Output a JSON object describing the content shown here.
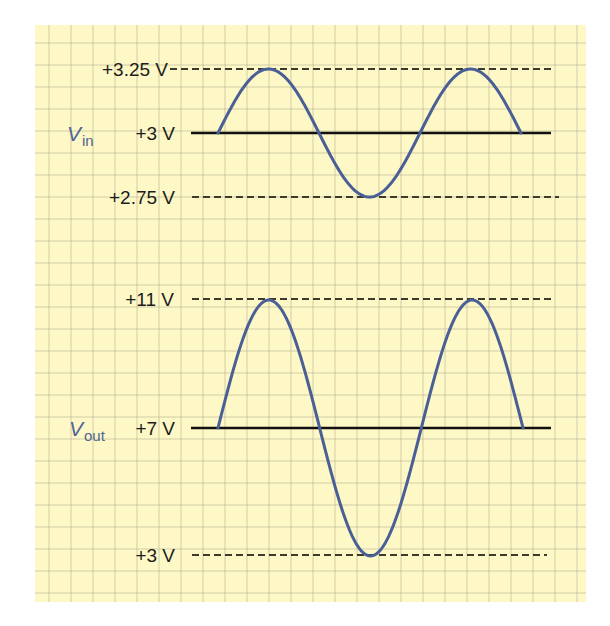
{
  "figure": {
    "background_color": "#fdf8c6",
    "grid_color": "#c9c5a3",
    "wave_color": "#4a5f96",
    "baseline_color": "#111111",
    "dash_color": "#3b3a2c"
  },
  "panels": [
    {
      "id": "input",
      "signal_symbol": "V",
      "signal_subscript": "in",
      "levels": {
        "max": "+3.25 V",
        "dc": "+3 V",
        "min": "+2.75 V"
      }
    },
    {
      "id": "output",
      "signal_symbol": "V",
      "signal_subscript": "out",
      "levels": {
        "max": "+11 V",
        "dc": "+7 V",
        "min": "+3 V"
      }
    }
  ],
  "chart_data": [
    {
      "type": "line",
      "title": "Vin",
      "series": [
        {
          "name": "Vin",
          "description": "sine wave, 1.5 cycles, DC offset +3 V, amplitude 0.25 V"
        }
      ],
      "dc_offset": 3,
      "amplitude": 0.25,
      "cycles": 1.5,
      "ylim": [
        2.75,
        3.25
      ],
      "ytick_labels": [
        "+3.25 V",
        "+3 V",
        "+2.75 V"
      ],
      "grid": true
    },
    {
      "type": "line",
      "title": "Vout",
      "series": [
        {
          "name": "Vout",
          "description": "sine wave, 1.5 cycles, DC offset +7 V, amplitude 4 V"
        }
      ],
      "dc_offset": 7,
      "amplitude": 4,
      "cycles": 1.5,
      "ylim": [
        3,
        11
      ],
      "ytick_labels": [
        "+11 V",
        "+7 V",
        "+3 V"
      ],
      "grid": true
    }
  ]
}
